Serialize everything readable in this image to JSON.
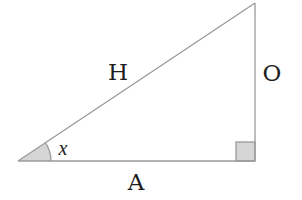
{
  "diagram": {
    "colors": {
      "stroke": "#9a9a9a",
      "shade": "#d6d6d6",
      "text": "#1e1e1e",
      "background": "#ffffff"
    },
    "vertices": {
      "angle_vertex": [
        18,
        161
      ],
      "right_angle_vertex": [
        255,
        161
      ],
      "top_vertex": [
        255,
        3
      ]
    },
    "labels": {
      "hypotenuse": "H",
      "opposite": "O",
      "adjacent": "A",
      "angle": "x"
    },
    "markers": {
      "angle_arc_radius": 33,
      "right_angle_square_size": 19
    }
  }
}
